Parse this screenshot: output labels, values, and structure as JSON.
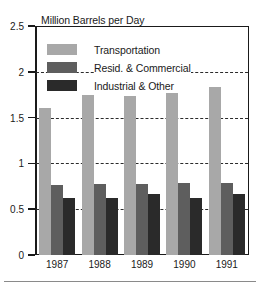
{
  "chart_data": {
    "type": "bar",
    "title": "Million Barrels per Day",
    "xlabel": "",
    "ylabel": "",
    "categories": [
      "1987",
      "1988",
      "1989",
      "1990",
      "1991"
    ],
    "series": [
      {
        "name": "Transportation",
        "color": "#a8a8a8",
        "values": [
          1.6,
          1.75,
          1.74,
          1.77,
          1.83
        ]
      },
      {
        "name": "Resid. & Commercial",
        "color": "#5e5e5e",
        "values": [
          0.76,
          0.77,
          0.77,
          0.79,
          0.79
        ]
      },
      {
        "name": "Industrial & Other",
        "color": "#2a2a2a",
        "values": [
          0.62,
          0.62,
          0.67,
          0.62,
          0.67
        ]
      }
    ],
    "ylim": [
      0,
      2.5
    ],
    "yticks": [
      0,
      0.5,
      1,
      1.5,
      2,
      2.5
    ],
    "ytick_labels": [
      "0",
      "0.5",
      "1",
      "1.5",
      "2",
      "2.5"
    ],
    "gridlines": [
      0.5,
      1,
      1.5,
      2
    ],
    "grid": true,
    "legend_position": "upper-left-inside"
  }
}
